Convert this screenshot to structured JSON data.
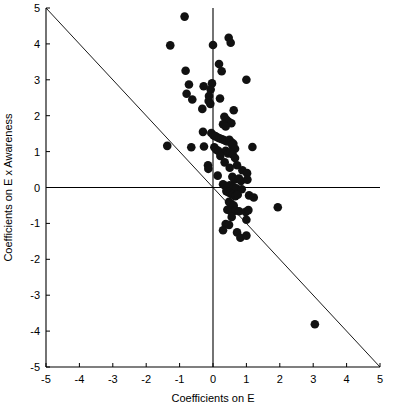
{
  "chart_data": {
    "type": "scatter",
    "title": "",
    "xlabel": "Coefficients on E",
    "ylabel": "Coefficients on E x Awareness",
    "xlim": [
      -5,
      5
    ],
    "ylim": [
      -5,
      5
    ],
    "xticks": [
      -5,
      -4,
      -3,
      -2,
      -1,
      0,
      1,
      2,
      3,
      4,
      5
    ],
    "yticks": [
      -5,
      -4,
      -3,
      -2,
      -1,
      0,
      1,
      2,
      3,
      4,
      5
    ],
    "xtick_labels": [
      "-5",
      "-4",
      "-3",
      "-2",
      "-1",
      "0",
      "1",
      "2",
      "3",
      "4",
      "5"
    ],
    "ytick_labels": [
      "-5",
      "-4",
      "-3",
      "-2",
      "-1",
      "0",
      "1",
      "2",
      "3",
      "4",
      "5"
    ],
    "grid": false,
    "legend": null,
    "marker": {
      "shape": "circle",
      "color": "#111111",
      "size": 5.4
    },
    "annotations": [
      {
        "type": "line",
        "name": "horizontal-zero-line",
        "y": 0,
        "x_from": -5,
        "x_to": 5
      },
      {
        "type": "line",
        "name": "vertical-zero-line",
        "x": 0,
        "y_from": -5,
        "y_to": 5
      },
      {
        "type": "line",
        "name": "negative-diagonal-reference-line",
        "from": [
          -5,
          5
        ],
        "to": [
          5,
          -5
        ],
        "slope": -1,
        "intercept": 0
      }
    ],
    "n_points": 104,
    "points": [
      [
        -0.85,
        4.76
      ],
      [
        -1.28,
        3.96
      ],
      [
        0.0,
        3.97
      ],
      [
        0.47,
        4.17
      ],
      [
        0.53,
        4.03
      ],
      [
        -0.82,
        3.25
      ],
      [
        0.18,
        3.44
      ],
      [
        0.26,
        3.24
      ],
      [
        1.0,
        3.0
      ],
      [
        -0.72,
        2.87
      ],
      [
        -0.79,
        2.61
      ],
      [
        -0.62,
        2.45
      ],
      [
        -0.28,
        2.82
      ],
      [
        -0.03,
        2.9
      ],
      [
        -0.07,
        2.73
      ],
      [
        -0.12,
        2.55
      ],
      [
        -0.13,
        2.41
      ],
      [
        -0.08,
        2.33
      ],
      [
        0.21,
        2.48
      ],
      [
        -0.32,
        2.19
      ],
      [
        0.62,
        2.15
      ],
      [
        0.34,
        1.97
      ],
      [
        0.41,
        1.88
      ],
      [
        0.48,
        1.82
      ],
      [
        0.55,
        1.79
      ],
      [
        0.3,
        1.76
      ],
      [
        0.38,
        1.7
      ],
      [
        -0.3,
        1.55
      ],
      [
        -0.05,
        1.52
      ],
      [
        0.02,
        1.45
      ],
      [
        0.07,
        1.43
      ],
      [
        0.13,
        1.4
      ],
      [
        0.19,
        1.37
      ],
      [
        0.25,
        1.35
      ],
      [
        0.31,
        1.33
      ],
      [
        0.37,
        1.3
      ],
      [
        0.43,
        1.28
      ],
      [
        0.49,
        1.33
      ],
      [
        0.55,
        1.26
      ],
      [
        0.61,
        1.22
      ],
      [
        -1.37,
        1.16
      ],
      [
        -0.65,
        1.12
      ],
      [
        -0.27,
        1.14
      ],
      [
        0.04,
        1.12
      ],
      [
        0.1,
        1.05
      ],
      [
        0.16,
        1.02
      ],
      [
        0.58,
        1.18
      ],
      [
        0.66,
        1.08
      ],
      [
        1.18,
        1.13
      ],
      [
        0.38,
        1.02
      ],
      [
        0.45,
        0.95
      ],
      [
        0.52,
        0.98
      ],
      [
        0.59,
        0.92
      ],
      [
        0.22,
        0.88
      ],
      [
        0.35,
        0.7
      ],
      [
        0.66,
        0.82
      ],
      [
        0.72,
        0.62
      ],
      [
        -0.15,
        0.62
      ],
      [
        -0.14,
        0.52
      ],
      [
        0.5,
        0.55
      ],
      [
        0.88,
        0.48
      ],
      [
        1.02,
        0.4
      ],
      [
        0.14,
        0.33
      ],
      [
        0.58,
        0.3
      ],
      [
        0.64,
        0.22
      ],
      [
        0.78,
        0.25
      ],
      [
        0.84,
        0.18
      ],
      [
        1.03,
        0.22
      ],
      [
        0.3,
        0.09
      ],
      [
        0.36,
        0.05
      ],
      [
        0.44,
        0.02
      ],
      [
        0.5,
        0.06
      ],
      [
        0.56,
        0.03
      ],
      [
        0.62,
        0.0
      ],
      [
        0.7,
        -0.02
      ],
      [
        0.86,
        -0.05
      ],
      [
        0.4,
        -0.1
      ],
      [
        0.46,
        -0.13
      ],
      [
        0.52,
        -0.16
      ],
      [
        0.58,
        -0.2
      ],
      [
        0.67,
        -0.24
      ],
      [
        0.74,
        -0.2
      ],
      [
        1.08,
        -0.22
      ],
      [
        1.22,
        -0.28
      ],
      [
        1.94,
        -0.55
      ],
      [
        0.48,
        -0.4
      ],
      [
        0.54,
        -0.45
      ],
      [
        0.62,
        -0.5
      ],
      [
        0.43,
        -0.62
      ],
      [
        0.52,
        -0.65
      ],
      [
        0.6,
        -0.66
      ],
      [
        0.68,
        -0.64
      ],
      [
        0.78,
        -0.66
      ],
      [
        0.98,
        -0.68
      ],
      [
        1.06,
        -0.63
      ],
      [
        0.56,
        -0.82
      ],
      [
        1.0,
        -0.9
      ],
      [
        0.38,
        -1.02
      ],
      [
        0.48,
        -1.04
      ],
      [
        0.3,
        -1.19
      ],
      [
        0.72,
        -1.25
      ],
      [
        0.82,
        -1.4
      ],
      [
        1.0,
        -1.34
      ],
      [
        3.05,
        -3.81
      ]
    ]
  }
}
